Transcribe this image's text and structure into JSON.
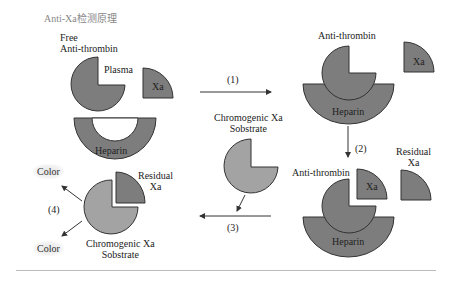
{
  "title": "Anti-Xa检测原理",
  "colors": {
    "dark_fill": "#7d7d7d",
    "light_fill": "#a3a3a3",
    "stroke": "#333333",
    "text": "#222222",
    "title": "#888888"
  },
  "panel1": {
    "free_at_line1": "Free",
    "free_at_line2": "Anti-thrombin",
    "plasma": "Plasma",
    "xa": "Xa",
    "heparin": "Heparin"
  },
  "panel2": {
    "antithrombin": "Anti-thrombin",
    "xa": "Xa",
    "heparin": "Heparin"
  },
  "panel3": {
    "antithrombin": "Anti-thrombin",
    "xa": "Xa",
    "heparin": "Heparin",
    "residual_line1": "Residual",
    "residual_line2": "Xa"
  },
  "panel4": {
    "residual_line1": "Residual",
    "residual_line2": "Xa",
    "substrate_line1": "Chromogenic Xa",
    "substrate_line2": "Sobstrate",
    "color_top": "Color",
    "color_bottom": "Color"
  },
  "middle": {
    "substrate_line1": "Chromogenic Xa",
    "substrate_line2": "Sobstrate"
  },
  "steps": {
    "s1": "(1)",
    "s2": "(2)",
    "s3": "(3)",
    "s4": "(4)"
  }
}
